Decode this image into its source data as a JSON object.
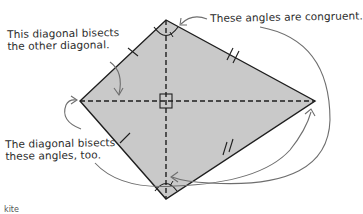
{
  "diagram": {
    "shape": "kite",
    "colors": {
      "fill": "#c9c9c9",
      "outline": "#1e1e1e",
      "diagonal": "#1e1e1e",
      "arrow": "#6e6e6e",
      "text": "#2b2b2b",
      "background": "#ffffff"
    },
    "vertices": {
      "top": [
        166,
        20
      ],
      "right": [
        315,
        101
      ],
      "bottom": [
        166,
        199
      ],
      "left": [
        80,
        101
      ]
    },
    "annotations": [
      {
        "id": "bisects-diagonal",
        "lines": [
          "This diagonal bisects",
          "the other diagonal."
        ]
      },
      {
        "id": "congruent-angles",
        "lines": [
          "These angles are congruent."
        ]
      },
      {
        "id": "bisects-angles",
        "lines": [
          "The diagonal bisects",
          "these angles, too."
        ]
      }
    ],
    "markers": {
      "right_angle": "square at diagonal intersection",
      "short_sides": "single tick marks",
      "long_sides": "double tick marks"
    },
    "footer_fragment": "kite"
  }
}
